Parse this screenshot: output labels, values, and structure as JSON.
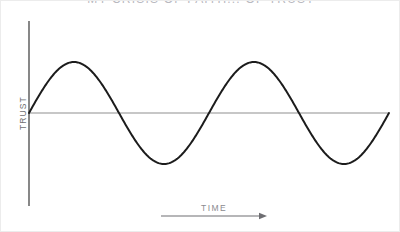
{
  "figure": {
    "title": "MY CRISIS OF FAITH... OF TRUST",
    "background_color": "#ffffff",
    "border_color": "#ececec"
  },
  "axes": {
    "y_label": "TRUST",
    "x_label": "TIME",
    "y_axis_color": "#555555",
    "baseline_color": "#8f8f8f",
    "arrow_color": "#6e6e72",
    "label_color": "#6f6f72"
  },
  "chart_data": {
    "type": "line",
    "title": "MY CRISIS OF FAITH... OF TRUST",
    "xlabel": "TIME",
    "ylabel": "TRUST",
    "grid": false,
    "legend": null,
    "axis_ticks": [],
    "series": [
      {
        "name": "Trust",
        "color": "#1c1c1c",
        "line_width": 2,
        "description": "Sine wave, two full cycles, starting at zero and rising",
        "waveform": {
          "shape": "sine",
          "cycles": 2,
          "amplitude": 1,
          "phase": 0,
          "baseline": 0
        },
        "x": [
          0,
          0.125,
          0.25,
          0.375,
          0.5,
          0.625,
          0.75,
          0.875,
          1.0,
          1.125,
          1.25,
          1.375,
          1.5,
          1.625,
          1.75,
          1.875,
          2.0
        ],
        "y": [
          0,
          0.71,
          1,
          0.71,
          0,
          -0.71,
          -1,
          -0.71,
          0,
          0.71,
          1,
          0.71,
          0,
          -0.71,
          -1,
          -0.71,
          0
        ]
      }
    ],
    "xlim": [
      0,
      2
    ],
    "ylim": [
      -1.15,
      1.15
    ]
  },
  "geometry": {
    "y_axis": {
      "x": 28,
      "y_top": 20,
      "y_bottom": 205
    },
    "baseline": {
      "y": 112,
      "x_start": 28,
      "x_end": 388
    },
    "wave": {
      "x_start": 28,
      "x_end": 388,
      "midline_y": 112,
      "amplitude_px": 51,
      "period_px": 180
    },
    "x_arrow": {
      "x_start": 160,
      "x_end": 266,
      "y": 215
    }
  }
}
